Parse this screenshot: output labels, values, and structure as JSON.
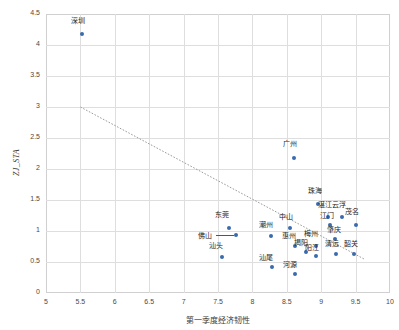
{
  "chart_data": {
    "type": "scatter",
    "title": "",
    "xlabel": "第一季度经济韧性",
    "ylabel": "ZJ_STA",
    "xlim": [
      5,
      10
    ],
    "ylim": [
      0,
      4.5
    ],
    "xticks": [
      "5",
      "5.5",
      "6",
      "6.5",
      "7",
      "7.5",
      "8",
      "8.5",
      "9",
      "9.5",
      "10"
    ],
    "yticks": [
      "0",
      "0.5",
      "1",
      "1.5",
      "2",
      "2.5",
      "3",
      "3.5",
      "4",
      "4.5"
    ],
    "grid": true,
    "legend": "none",
    "marker_color": "#3a6bad",
    "trendline": {
      "style": "dotted",
      "color": "#9a9a9a",
      "x0": 5.5,
      "y0": 3.0,
      "x1": 9.62,
      "y1": 0.55
    },
    "points": [
      {
        "label": "深圳",
        "x": 5.52,
        "y": 4.17,
        "lx": 5.5,
        "ly": 4.4
      },
      {
        "label": "广州",
        "x": 8.6,
        "y": 2.17,
        "lx": 8.58,
        "ly": 2.42
      },
      {
        "label": "珠海",
        "x": 8.96,
        "y": 1.43,
        "lx": 8.94,
        "ly": 1.66
      },
      {
        "label": "湛江",
        "x": 9.1,
        "y": 1.22,
        "lx": 9.08,
        "ly": 1.44
      },
      {
        "label": "云浮",
        "x": 9.3,
        "y": 1.22,
        "lx": 9.29,
        "ly": 1.44
      },
      {
        "label": "江门",
        "x": 9.13,
        "y": 1.1,
        "lx": 9.12,
        "ly": 1.26
      },
      {
        "label": "茂名",
        "x": 9.5,
        "y": 1.1,
        "lx": 9.48,
        "ly": 1.32
      },
      {
        "label": "东莞",
        "x": 7.66,
        "y": 1.05,
        "lx": 7.58,
        "ly": 1.27
      },
      {
        "label": "中山",
        "x": 8.55,
        "y": 1.05,
        "lx": 8.52,
        "ly": 1.25
      },
      {
        "label": "佛山",
        "x": 7.76,
        "y": 0.93,
        "lx": 7.34,
        "ly": 0.93
      },
      {
        "label": "潮州",
        "x": 8.27,
        "y": 0.92,
        "lx": 8.22,
        "ly": 1.12
      },
      {
        "label": "肇庆",
        "x": 9.2,
        "y": 0.87,
        "lx": 9.22,
        "ly": 1.03
      },
      {
        "label": "惠州",
        "x": 8.62,
        "y": 0.76,
        "lx": 8.56,
        "ly": 0.93
      },
      {
        "label": "梅州",
        "x": 8.92,
        "y": 0.76,
        "lx": 8.88,
        "ly": 0.96
      },
      {
        "label": "清远",
        "x": 9.22,
        "y": 0.63,
        "lx": 9.18,
        "ly": 0.8
      },
      {
        "label": "韶关",
        "x": 9.48,
        "y": 0.63,
        "lx": 9.46,
        "ly": 0.8
      },
      {
        "label": "揭阳",
        "x": 8.78,
        "y": 0.66,
        "lx": 8.73,
        "ly": 0.83
      },
      {
        "label": "阳江",
        "x": 8.92,
        "y": 0.6,
        "lx": 8.9,
        "ly": 0.74
      },
      {
        "label": "汕头",
        "x": 7.56,
        "y": 0.58,
        "lx": 7.5,
        "ly": 0.78
      },
      {
        "label": "汕尾",
        "x": 8.28,
        "y": 0.42,
        "lx": 8.22,
        "ly": 0.58
      },
      {
        "label": "河源",
        "x": 8.62,
        "y": 0.3,
        "lx": 8.58,
        "ly": 0.47
      }
    ]
  }
}
